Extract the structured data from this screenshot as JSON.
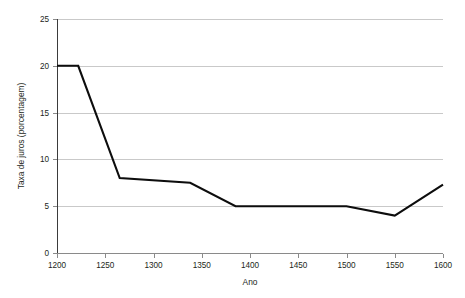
{
  "figure": {
    "background_color": "#ffffff",
    "has_title": false
  },
  "chart_data": {
    "type": "line",
    "title": "",
    "subtitle": "",
    "xlabel": "Ano",
    "ylabel": "Taxa de juros (porcentagem)",
    "xlim": [
      1200,
      1600
    ],
    "ylim": [
      0,
      25
    ],
    "xticks": [
      1200,
      1250,
      1300,
      1350,
      1400,
      1450,
      1500,
      1550,
      1600
    ],
    "xtick_labels": [
      "1200",
      "1250",
      "1300",
      "1350",
      "1400",
      "1450",
      "1500",
      "1550",
      "1600"
    ],
    "yticks": [
      0,
      5,
      10,
      15,
      20,
      25
    ],
    "ytick_labels": [
      "0",
      "5",
      "10",
      "15",
      "20",
      "25"
    ],
    "grid": {
      "horizontal": true,
      "vertical": false,
      "color": "#c9c9c9"
    },
    "legend": {
      "visible": false,
      "position": "none"
    },
    "series": [
      {
        "name": "Taxa de juros",
        "color": "#0d0d0d",
        "line_width": 2.1,
        "x": [
          1200,
          1222,
          1265,
          1338,
          1385,
          1500,
          1550,
          1600
        ],
        "y": [
          20,
          20,
          8,
          7.5,
          5,
          5,
          4,
          7.3
        ]
      }
    ]
  }
}
